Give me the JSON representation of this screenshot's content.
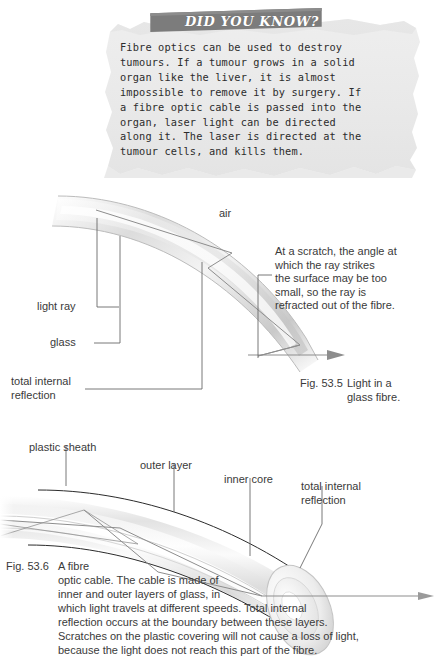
{
  "page": {
    "background": "#ffffff",
    "banner_color": "#7c7c7c",
    "paper_color": "#ebebeb"
  },
  "did_you_know": {
    "banner_label": "DID YOU KNOW?",
    "body": "Fibre optics can be used to destroy\ntumours. If a tumour grows in a solid\norgan like the liver, it is almost\nimpossible to remove it by surgery. If\na fibre optic cable is passed into the\norgan, laser light can be directed\nalong it. The laser is directed at the\ntumour cells, and kills them."
  },
  "figure_535": {
    "air_label": "air",
    "labels": {
      "light_ray": "light ray",
      "glass": "glass",
      "total_internal_reflection": "total internal\nreflection"
    },
    "annotation": "At a scratch, the angle at\nwhich the ray strikes\nthe surface may be too\nsmall, so the ray is\nrefracted out of the fibre.",
    "caption_number": "Fig. 53.5",
    "caption_text": "Light in a\nglass fibre."
  },
  "figure_536": {
    "labels": {
      "plastic_sheath": "plastic sheath",
      "outer_layer": "outer layer",
      "inner_core": "inner core",
      "total_internal_reflection": "total internal\nreflection"
    },
    "caption_number": "Fig. 53.6",
    "caption_text": "A fibre\noptic cable. The cable is made of\ninner and outer layers of glass, in\nwhich light travels at different speeds. Total internal\nreflection occurs at the boundary between these layers.\nScratches on the plastic covering will not cause a loss of light,\nbecause the light does not reach this part of the fibre."
  }
}
